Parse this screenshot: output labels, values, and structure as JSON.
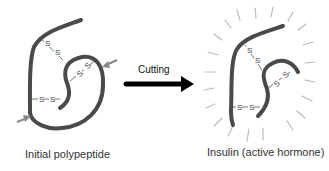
{
  "diagram": {
    "left_panel": {
      "label": "Initial polypeptide",
      "disulfide_bonds": [
        "S–S",
        "S–S",
        "S–S"
      ],
      "cut_markers": 2
    },
    "arrow": {
      "label": "Cutting"
    },
    "right_panel": {
      "label": "Insulin (active hormone)",
      "disulfide_bonds": [
        "S–S",
        "S–S",
        "S–S"
      ]
    },
    "colors": {
      "strand": "#4a4a4a",
      "bond": "#777777",
      "cut_marker": "#888888",
      "rays": "#bbbbbb",
      "arrow": "#000000"
    }
  }
}
